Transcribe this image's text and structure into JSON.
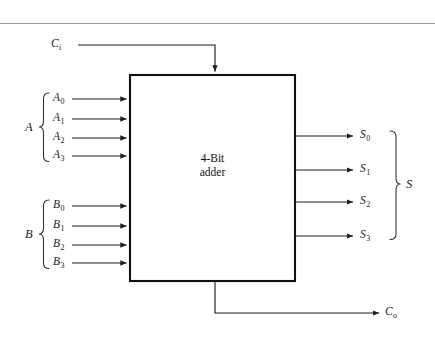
{
  "figure": {
    "block": {
      "label_line1": "4-Bit",
      "label_line2": "adder"
    },
    "carry_in": {
      "name": "C",
      "subscript": "i"
    },
    "carry_out": {
      "name": "C",
      "subscript": "o"
    },
    "input_group_a": {
      "group_label": "A",
      "bits": [
        {
          "name": "A",
          "subscript": "0"
        },
        {
          "name": "A",
          "subscript": "1"
        },
        {
          "name": "A",
          "subscript": "2"
        },
        {
          "name": "A",
          "subscript": "3"
        }
      ]
    },
    "input_group_b": {
      "group_label": "B",
      "bits": [
        {
          "name": "B",
          "subscript": "0"
        },
        {
          "name": "B",
          "subscript": "1"
        },
        {
          "name": "B",
          "subscript": "2"
        },
        {
          "name": "B",
          "subscript": "3"
        }
      ]
    },
    "output_group_s": {
      "group_label": "S",
      "bits": [
        {
          "name": "S",
          "subscript": "0"
        },
        {
          "name": "S",
          "subscript": "1"
        },
        {
          "name": "S",
          "subscript": "2"
        },
        {
          "name": "S",
          "subscript": "3"
        }
      ]
    },
    "colors": {
      "line": "#1f1f1f",
      "box_border": "#111111",
      "rule": "#9a9a9a",
      "background": "#ffffff"
    }
  }
}
